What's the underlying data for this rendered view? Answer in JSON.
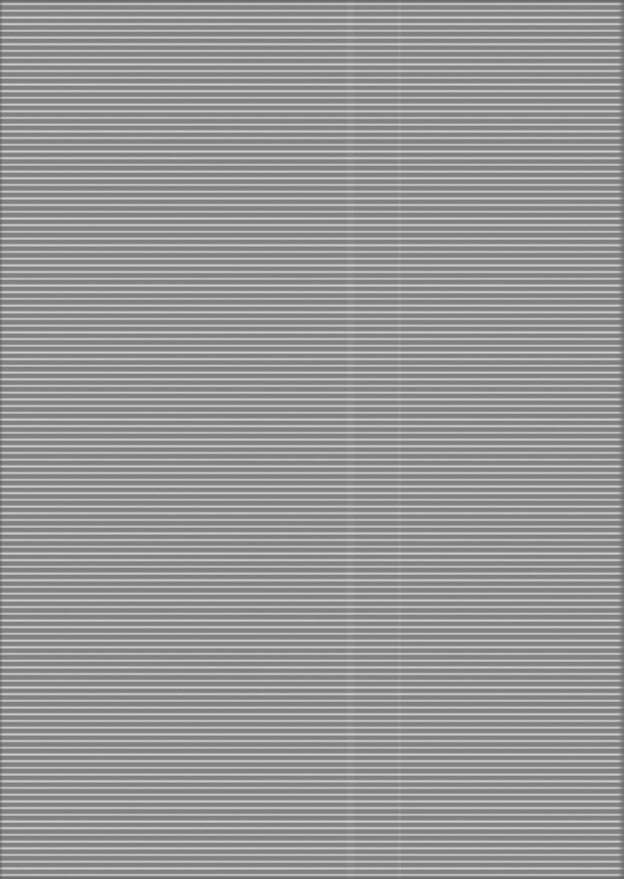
{
  "page": {
    "content": "abstract horizontal stripe texture, no visible text or controls"
  },
  "pattern": {
    "type": "horizontal-stripes",
    "orientation": "horizontal",
    "period_px": 6.7,
    "light_line_thickness_px": 1.5,
    "approx_line_count": 131,
    "colors": {
      "stripe-dark": "#7f7f7f",
      "stripe-mid": "#a6a6a6",
      "stripe-light": "#dedede",
      "edge-shade": "#6e6e6e"
    }
  }
}
